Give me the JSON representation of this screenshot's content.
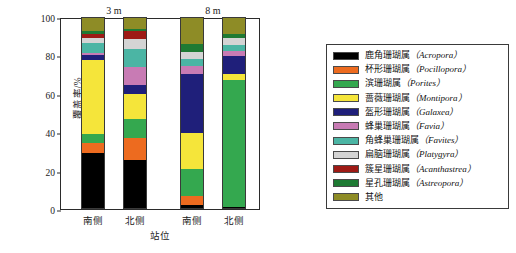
{
  "chart_data": {
    "type": "bar",
    "subtype": "stacked-percentage",
    "title": "",
    "xlabel": "站位",
    "ylabel": "覆盖率/%",
    "ylim": [
      0,
      100
    ],
    "yticks": [
      0,
      20,
      40,
      60,
      80,
      100
    ],
    "grid": false,
    "legend_position": "right",
    "group_labels": [
      "3 m",
      "8 m"
    ],
    "categories": [
      "南侧",
      "北侧",
      "南侧",
      "北侧"
    ],
    "category_groups": [
      "3 m",
      "3 m",
      "8 m",
      "8 m"
    ],
    "series": [
      {
        "name": "鹿角珊瑚属（Acropora）",
        "color": "#000000",
        "values": [
          29.0,
          25.5,
          2.0,
          1.0
        ]
      },
      {
        "name": "杯形珊瑚属（Pocillopora）",
        "color": "#ED6B1F",
        "values": [
          5.5,
          11.5,
          5.0,
          0.0
        ]
      },
      {
        "name": "滨珊瑚属（Porites）",
        "color": "#34A84F",
        "values": [
          4.5,
          10.0,
          14.0,
          66.0
        ]
      },
      {
        "name": "蔷薇珊瑚属（Montipora）",
        "color": "#F5E53A",
        "values": [
          38.5,
          13.0,
          18.5,
          3.5
        ]
      },
      {
        "name": "盔形珊瑚属（Galaxea）",
        "color": "#1F1F7A",
        "values": [
          2.5,
          4.5,
          31.0,
          9.0
        ]
      },
      {
        "name": "蜂巢珊瑚属（Favia）",
        "color": "#C87BB4",
        "values": [
          1.5,
          9.5,
          4.0,
          3.0
        ]
      },
      {
        "name": "角蜂巢珊瑚属（Favites）",
        "color": "#4BB5A4",
        "values": [
          5.0,
          9.5,
          3.5,
          3.0
        ]
      },
      {
        "name": "扁脑珊瑚属（Platygyra）",
        "color": "#D4D4D4",
        "values": [
          2.5,
          5.0,
          4.0,
          3.5
        ]
      },
      {
        "name": "簇星珊瑚属（Acanthastrea）",
        "color": "#9E1A15",
        "values": [
          2.0,
          4.5,
          0.0,
          0.0
        ]
      },
      {
        "name": "星孔珊瑚属（Astreopora）",
        "color": "#1E7A33",
        "values": [
          1.5,
          1.0,
          4.0,
          2.0
        ]
      },
      {
        "name": "其他",
        "color": "#8E8C26",
        "values": [
          7.5,
          6.0,
          14.0,
          9.0
        ]
      }
    ]
  },
  "axes": {
    "y_label": "覆盖率/%",
    "x_label": "站位",
    "y_ticks": [
      "0",
      "20",
      "40",
      "60",
      "80",
      "100"
    ]
  },
  "groups": [
    {
      "label": "3 m"
    },
    {
      "label": "8 m"
    }
  ],
  "bars": [
    {
      "label": "南侧"
    },
    {
      "label": "北侧"
    },
    {
      "label": "南侧"
    },
    {
      "label": "北侧"
    }
  ],
  "legend": {
    "items": [
      {
        "label_cn": "鹿角珊瑚属",
        "label_sci": "（Acropora）",
        "color": "#000000"
      },
      {
        "label_cn": "杯形珊瑚属",
        "label_sci": "（Pocillopora）",
        "color": "#ED6B1F"
      },
      {
        "label_cn": "滨珊瑚属",
        "label_sci": "（Porites）",
        "color": "#34A84F"
      },
      {
        "label_cn": "蔷薇珊瑚属",
        "label_sci": "（Montipora）",
        "color": "#F5E53A"
      },
      {
        "label_cn": "盔形珊瑚属",
        "label_sci": "（Galaxea）",
        "color": "#1F1F7A"
      },
      {
        "label_cn": "蜂巢珊瑚属",
        "label_sci": "（Favia）",
        "color": "#C87BB4"
      },
      {
        "label_cn": "角蜂巢珊瑚属",
        "label_sci": "（Favites）",
        "color": "#4BB5A4"
      },
      {
        "label_cn": "扁脑珊瑚属",
        "label_sci": "（Platygyra）",
        "color": "#D4D4D4"
      },
      {
        "label_cn": "簇星珊瑚属",
        "label_sci": "（Acanthastrea）",
        "color": "#9E1A15"
      },
      {
        "label_cn": "星孔珊瑚属",
        "label_sci": "（Astreopora）",
        "color": "#1E7A33"
      },
      {
        "label_cn": "其他",
        "label_sci": "",
        "color": "#8E8C26"
      }
    ]
  }
}
